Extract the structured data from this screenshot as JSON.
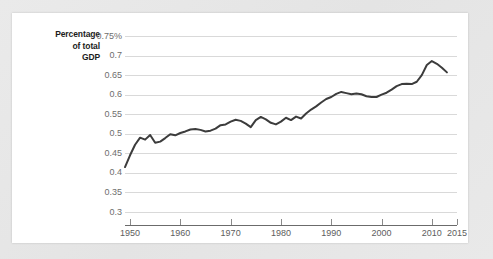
{
  "chart_data": {
    "type": "line",
    "title": "",
    "ylabel": "Percentage of total GDP",
    "xlabel": "",
    "ylabel_lines": [
      "Percentage",
      "of total",
      "GDP"
    ],
    "grid": true,
    "legend": "none",
    "xlim": [
      1949,
      2015
    ],
    "ylim": [
      0.3,
      0.75
    ],
    "yticks": [
      0.3,
      0.35,
      0.4,
      0.45,
      0.5,
      0.55,
      0.6,
      0.65,
      0.7,
      0.75
    ],
    "ytick_labels": [
      "0.3",
      "0.35",
      "0.4",
      "0.45",
      "0.5",
      "0.55",
      "0.6",
      "0.65",
      "0.7",
      "0.75%"
    ],
    "xticks": [
      1950,
      1960,
      1970,
      1980,
      1990,
      2000,
      2010,
      2015
    ],
    "xtick_labels": [
      "1950",
      "1960",
      "1970",
      "1980",
      "1990",
      "2000",
      "2010",
      "2015"
    ],
    "series": [
      {
        "name": "Percentage of total GDP",
        "color": "#3c3c3c",
        "x": [
          1949,
          1950,
          1951,
          1952,
          1953,
          1954,
          1955,
          1956,
          1957,
          1958,
          1959,
          1960,
          1961,
          1962,
          1963,
          1964,
          1965,
          1966,
          1967,
          1968,
          1969,
          1970,
          1971,
          1972,
          1973,
          1974,
          1975,
          1976,
          1977,
          1978,
          1979,
          1980,
          1981,
          1982,
          1983,
          1984,
          1985,
          1986,
          1987,
          1988,
          1989,
          1990,
          1991,
          1992,
          1993,
          1994,
          1995,
          1996,
          1997,
          1998,
          1999,
          2000,
          2001,
          2002,
          2003,
          2004,
          2005,
          2006,
          2007,
          2008,
          2009,
          2010,
          2011,
          2012,
          2013
        ],
        "values": [
          0.415,
          0.445,
          0.472,
          0.49,
          0.485,
          0.497,
          0.477,
          0.48,
          0.489,
          0.499,
          0.496,
          0.502,
          0.506,
          0.511,
          0.512,
          0.51,
          0.506,
          0.508,
          0.513,
          0.522,
          0.524,
          0.531,
          0.536,
          0.533,
          0.526,
          0.517,
          0.535,
          0.543,
          0.537,
          0.528,
          0.524,
          0.531,
          0.541,
          0.535,
          0.544,
          0.539,
          0.552,
          0.562,
          0.57,
          0.58,
          0.589,
          0.594,
          0.602,
          0.607,
          0.604,
          0.601,
          0.603,
          0.601,
          0.596,
          0.594,
          0.594,
          0.6,
          0.605,
          0.613,
          0.622,
          0.627,
          0.628,
          0.627,
          0.633,
          0.65,
          0.676,
          0.686,
          0.679,
          0.669,
          0.657
        ]
      }
    ]
  },
  "axis_labels": {
    "y_title_line1": "Percentage",
    "y_title_line2": "of total",
    "y_title_line3": "GDP"
  }
}
